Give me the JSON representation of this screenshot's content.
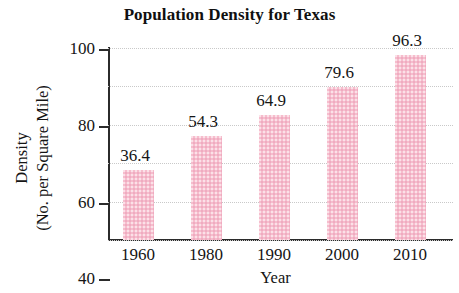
{
  "chart_data": {
    "type": "bar",
    "title": "Population Density for Texas",
    "xlabel": "Year",
    "ylabel_line1": "Density",
    "ylabel_line2": "(No. per Square Mile)",
    "categories": [
      "1960",
      "1980",
      "1990",
      "2000",
      "2010"
    ],
    "values": [
      36.4,
      54.3,
      64.9,
      79.6,
      96.3
    ],
    "value_labels": [
      "36.4",
      "54.3",
      "64.9",
      "79.6",
      "96.3"
    ],
    "ylim": [
      0,
      100
    ],
    "yticks": [
      0,
      20,
      40,
      60,
      80,
      100
    ],
    "ytick_labels": [
      "0",
      "20",
      "40",
      "60",
      "80",
      "100"
    ],
    "grid": true,
    "legend": null,
    "bar_color": "#f6bdcd",
    "axis_color": "#2b2b2b",
    "gridline_color": "#c9c9c9"
  }
}
